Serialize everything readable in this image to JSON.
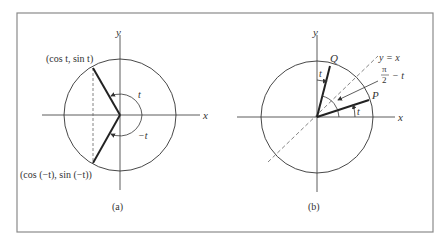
{
  "figure": {
    "border_color": "#8a8a8a",
    "line_color": "#333333",
    "panels": [
      {
        "caption": "(a)",
        "axes": {
          "x": "x",
          "y": "y"
        },
        "labels": {
          "upper_point": "(cos t,  sin t)",
          "lower_point": "(cos (−t),  sin (−t))",
          "angle_positive": "t",
          "angle_negative": "−t"
        }
      },
      {
        "caption": "(b)",
        "axes": {
          "x": "x",
          "y": "y"
        },
        "labels": {
          "point_q": "Q",
          "point_p": "P",
          "line": "y = x",
          "angle_q": "t",
          "angle_p": "t",
          "complement_num": "π",
          "complement_den": "2",
          "complement_rest": "− t"
        }
      }
    ]
  }
}
